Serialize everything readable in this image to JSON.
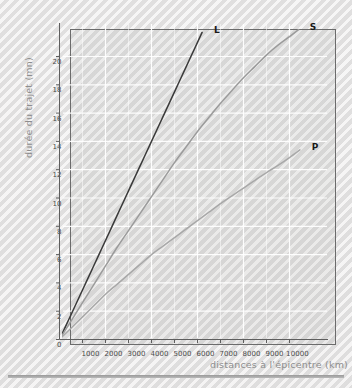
{
  "chart_data": {
    "type": "line",
    "title": "",
    "xlabel": "distances à l'épicentre (km)",
    "ylabel": "durée du trajet (mn)",
    "xlim": [
      0,
      11565
    ],
    "ylim": [
      0,
      22.6
    ],
    "grid": true,
    "legend_position": "inline-end-of-line",
    "xticks": [
      1000,
      2000,
      3000,
      4000,
      5000,
      6000,
      7000,
      8000,
      9000,
      10000
    ],
    "xtick_labels": [
      "1000",
      "2000",
      "3000",
      "4000",
      "5000",
      "6000",
      "7000",
      "8000",
      "9000",
      "10000"
    ],
    "yticks": [
      0,
      2,
      4,
      6,
      8,
      10,
      12,
      14,
      16,
      18,
      20
    ],
    "ytick_labels": [
      "0",
      "2",
      "4",
      "6",
      "8",
      "10",
      "12",
      "14",
      "16",
      "18",
      "20"
    ],
    "series": [
      {
        "name": "L",
        "label": "L",
        "color": "#3a3a3a",
        "x": [
          0,
          500,
          1000,
          1500,
          2000,
          2500,
          3000,
          3500,
          4000,
          4500,
          5000,
          5500,
          6000,
          6200
        ],
        "y": [
          0,
          1.75,
          3.5,
          5.25,
          7.0,
          8.75,
          10.5,
          12.25,
          14.0,
          15.75,
          17.5,
          19.25,
          21.0,
          21.7
        ]
      },
      {
        "name": "S",
        "label": "S",
        "color": "#9b9b9b",
        "x": [
          0,
          500,
          1000,
          1500,
          2000,
          2500,
          3000,
          3500,
          4000,
          4500,
          5000,
          5500,
          6000,
          6500,
          7000,
          7500,
          8000,
          8500,
          9000,
          9500,
          10000,
          10400
        ],
        "y": [
          0,
          1.3,
          2.6,
          3.9,
          5.2,
          6.5,
          7.7,
          8.9,
          10.1,
          11.3,
          12.5,
          13.6,
          14.7,
          15.7,
          16.7,
          17.6,
          18.5,
          19.3,
          20.1,
          20.8,
          21.4,
          21.9
        ]
      },
      {
        "name": "P",
        "label": "P",
        "color": "#a8a8a8",
        "x": [
          0,
          500,
          1000,
          1500,
          2000,
          2500,
          3000,
          3500,
          4000,
          4500,
          5000,
          5500,
          6000,
          6500,
          7000,
          7500,
          8000,
          8500,
          9000,
          9500,
          10000,
          10450
        ],
        "y": [
          0,
          0.8,
          1.6,
          2.4,
          3.2,
          3.9,
          4.6,
          5.3,
          6.0,
          6.6,
          7.2,
          7.8,
          8.4,
          9.0,
          9.6,
          10.15,
          10.7,
          11.25,
          11.8,
          12.3,
          12.85,
          13.4
        ]
      }
    ]
  },
  "series_labels": {
    "L": "L",
    "S": "S",
    "P": "P"
  }
}
